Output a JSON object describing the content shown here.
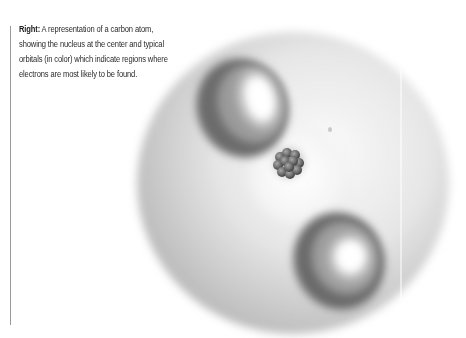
{
  "caption": {
    "label": "Right:",
    "lines": [
      "A representation of a carbon atom,",
      "showing the nucleus at the center and typical",
      "orbitals (in color) which indicate regions where",
      "electrons are most likely to be found."
    ]
  },
  "figure": {
    "subject": "carbon atom",
    "elements": [
      "outer-orbital-sphere",
      "upper-orbital-lobe",
      "lower-orbital-lobe",
      "inner-glow",
      "nucleus"
    ],
    "colors": {
      "sphere_edge": "#b8b8b8",
      "sphere_center": "#f2f2f2",
      "lobe_dark": "#6a6a6a",
      "lobe_highlight": "#ffffff",
      "nucleus": "#6e6e6e",
      "rule": "#9a9a9a"
    }
  }
}
